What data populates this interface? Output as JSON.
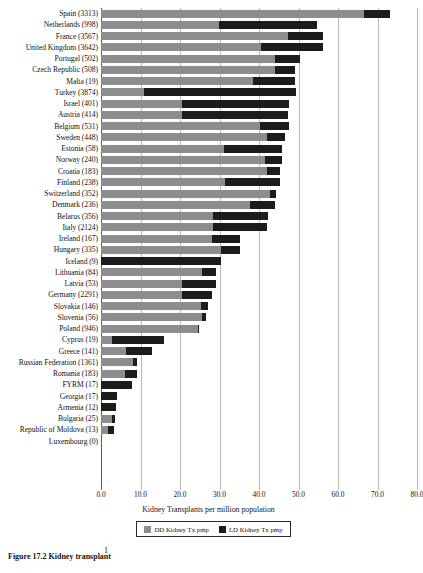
{
  "chart_data": {
    "type": "bar",
    "orientation": "horizontal",
    "stacked": true,
    "title": "",
    "xlabel": "Kidney Transplants per million population",
    "ylabel": "",
    "xlim": [
      0.0,
      80.0
    ],
    "xticks": [
      "0.0",
      "10.0",
      "20.0",
      "30.0",
      "40.0",
      "50.0",
      "60.0",
      "70.0",
      "80.0"
    ],
    "xtick_values": [
      0,
      10,
      20,
      30,
      40,
      50,
      60,
      70,
      80
    ],
    "grid": true,
    "legend_position": "bottom-center",
    "legend": [
      {
        "name": "DD Kidney Tx pmp",
        "color": "#8d8d8d"
      },
      {
        "name": "LD Kidney Tx pmp",
        "color": "#1c1c1c"
      }
    ],
    "series": [
      {
        "name": "DD Kidney Tx pmp",
        "color": "#8d8d8d",
        "values": [
          66.7,
          29.8,
          47.4,
          40.5,
          44.0,
          44.0,
          38.6,
          11.0,
          20.6,
          20.6,
          40.2,
          42.1,
          31.1,
          41.6,
          42.1,
          31.4,
          42.9,
          37.8,
          28.4,
          28.4,
          28.2,
          30.3,
          0.0,
          25.5,
          20.4,
          20.4,
          25.2,
          25.5,
          24.5,
          2.9,
          6.4,
          8.0,
          6.2,
          0.0,
          0.0,
          0.0,
          2.8,
          1.8,
          0.0
        ]
      },
      {
        "name": "LD Kidney Tx pmp",
        "color": "#1c1c1c",
        "values": [
          6.5,
          24.9,
          8.9,
          15.8,
          6.4,
          5.1,
          10.5,
          38.3,
          27.1,
          26.8,
          7.5,
          4.5,
          14.7,
          4.2,
          3.2,
          13.9,
          1.3,
          6.2,
          14.0,
          13.7,
          6.9,
          4.8,
          30.3,
          3.7,
          8.6,
          7.8,
          1.9,
          1.1,
          0.3,
          13.0,
          6.5,
          1.1,
          2.9,
          7.8,
          4.0,
          3.8,
          0.8,
          1.5,
          0.0
        ]
      }
    ],
    "categories": [
      "Spain (3313)",
      "Netherlands (998)",
      "France (3567)",
      "United Kingdom (3642)",
      "Portugal (502)",
      "Czech Republic (508)",
      "Malta (19)",
      "Turkey (3874)",
      "Israel (401)",
      "Austria (414)",
      "Belgium (531)",
      "Sweden (448)",
      "Estonia (58)",
      "Norway (240)",
      "Croatia (183)",
      "Finland (238)",
      "Switzerland (352)",
      "Denmark (236)",
      "Belarus (356)",
      "Italy (2124)",
      "Ireland (167)",
      "Hungary (335)",
      "Iceland (9)",
      "Lithuania (84)",
      "Latvia (53)",
      "Germany (2291)",
      "Slovakia (146)",
      "Slovenia (56)",
      "Poland (946)",
      "Cyprus (19)",
      "Greece (141)",
      "Russian Federation (1361)",
      "Romania (183)",
      "FYRM (17)",
      "Georgia (17)",
      "Armenia (12)",
      "Bulgaria (25)",
      "Republic of Moldova (13)",
      "Luxembourg (0)"
    ]
  },
  "caption": {
    "text": "Figure 17.2   Kidney transplant",
    "tick_mark": "1"
  }
}
